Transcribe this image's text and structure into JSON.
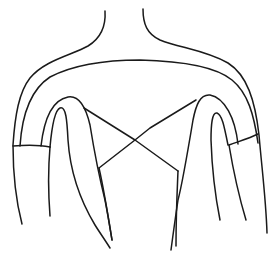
{
  "figure": {
    "subject": "Line drawing of the back of a garment (bodice with shoulder yoke, sleeves and crossed back straps)",
    "stroke_color": "#1a1a1a",
    "background_color": "#ffffff"
  },
  "parts": {
    "neck": "neck-outline",
    "shoulders": "outer-shoulder-outline",
    "yoke": "inner-yoke-arc",
    "left_sleeve": "left-sleeve-cuff",
    "right_sleeve": "right-sleeve-cuff",
    "left_armhole": "left-armhole-loop",
    "right_armhole": "right-armhole-loop",
    "straps": "crossed-back-straps"
  }
}
